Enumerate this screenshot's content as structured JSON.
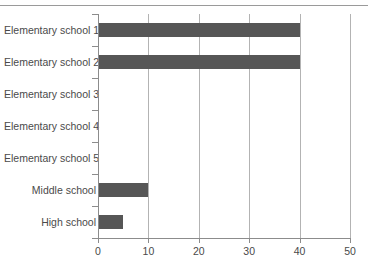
{
  "chart_data": {
    "type": "bar",
    "orientation": "horizontal",
    "title": "",
    "xlabel": "",
    "ylabel": "",
    "categories": [
      "Elementary school 1",
      "Elementary school 2",
      "Elementary school 3",
      "Elementary school 4",
      "Elementary school 5",
      "Middle school",
      "High school"
    ],
    "values": [
      40,
      40,
      0,
      0,
      0,
      10,
      5
    ],
    "xlim": [
      0,
      50
    ],
    "xticks": [
      0,
      10,
      20,
      30,
      40,
      50
    ],
    "xtick_labels": [
      "0",
      "10",
      "20",
      "30",
      "40",
      "50"
    ],
    "grid": "vertical",
    "legend": "none",
    "colors": {
      "bar": "#565656",
      "gridline": "#b3b3b3",
      "axis": "#8c8c8c",
      "text": "#4a4a4a",
      "background": "#ffffff",
      "top_rule": "#9a9a9a"
    }
  }
}
